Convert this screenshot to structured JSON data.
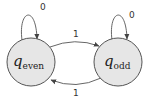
{
  "diagram": {
    "type": "finite-state-automaton",
    "states": [
      {
        "id": "q_even",
        "symbol": "q",
        "subscript": "even",
        "cx": 31,
        "cy": 62,
        "r": 24
      },
      {
        "id": "q_odd",
        "symbol": "q",
        "subscript": "odd",
        "cx": 118,
        "cy": 62,
        "r": 24
      }
    ],
    "transitions": [
      {
        "from": "q_even",
        "to": "q_even",
        "label": "0"
      },
      {
        "from": "q_odd",
        "to": "q_odd",
        "label": "0"
      },
      {
        "from": "q_even",
        "to": "q_odd",
        "label": "1"
      },
      {
        "from": "q_odd",
        "to": "q_even",
        "label": "1"
      }
    ],
    "colors": {
      "state_fill": "#e6e6e6",
      "stroke": "#555555",
      "text": "#222222"
    }
  }
}
